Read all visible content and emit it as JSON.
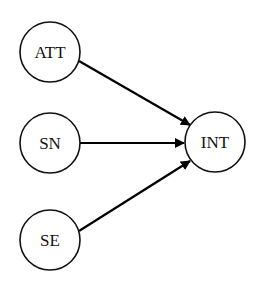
{
  "diagram": {
    "type": "path-diagram",
    "nodes": [
      {
        "id": "att",
        "label": "ATT",
        "cx": 50,
        "cy": 52,
        "r": 30
      },
      {
        "id": "sn",
        "label": "SN",
        "cx": 50,
        "cy": 143,
        "r": 30
      },
      {
        "id": "se",
        "label": "SE",
        "cx": 50,
        "cy": 240,
        "r": 30
      },
      {
        "id": "int",
        "label": "INT",
        "cx": 215,
        "cy": 142,
        "r": 30
      }
    ],
    "edges": [
      {
        "from": "ATT",
        "to": "INT"
      },
      {
        "from": "SN",
        "to": "INT"
      },
      {
        "from": "SE",
        "to": "INT"
      }
    ],
    "colors": {
      "stroke": "#111111",
      "background": "#ffffff"
    }
  }
}
